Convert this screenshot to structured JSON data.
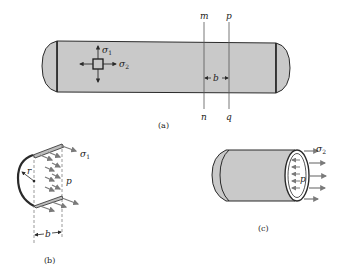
{
  "figure": {
    "panel_a": {
      "caption": "(a)",
      "element_stresses": {
        "sigma1": "σ",
        "sigma1_sub": "1",
        "sigma2": "σ",
        "sigma2_sub": "2"
      },
      "section_lines": {
        "m": "m",
        "n": "n",
        "p": "p",
        "q": "q"
      },
      "spacing_label": "b"
    },
    "panel_b": {
      "caption": "(b)",
      "radius_label": "r",
      "pressure_label": "p",
      "stress_label": "σ",
      "stress_sub": "1",
      "width_label": "b"
    },
    "panel_c": {
      "caption": "(c)",
      "pressure_label": "p",
      "stress_label": "σ",
      "stress_sub": "2"
    },
    "colors": {
      "fill_gray": "#c9c9c9",
      "stroke": "#2a2a2a",
      "arrow_gray": "#7a7a7a"
    }
  }
}
